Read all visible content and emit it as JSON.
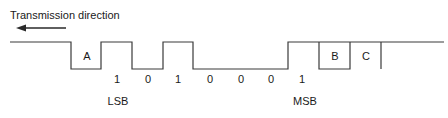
{
  "title": "Transmission direction",
  "colors": {
    "stroke": "#3a3a3a",
    "text": "#1a1a1a",
    "background": "#ffffff"
  },
  "arrow": {
    "direction": "left",
    "x1": 66,
    "x2": 18,
    "y": 28
  },
  "waveform": {
    "high_y": 42,
    "low_y": 69,
    "segments_labels": [
      "A",
      "B",
      "C"
    ],
    "bits": [
      "1",
      "0",
      "1",
      "0",
      "0",
      "0",
      "1"
    ],
    "lsb_label": "LSB",
    "msb_label": "MSB"
  },
  "labels": {
    "A": "A",
    "B": "B",
    "C": "C",
    "bit0": "1",
    "bit1": "0",
    "bit2": "1",
    "bit3": "0",
    "bit4": "0",
    "bit5": "0",
    "bit6": "1",
    "lsb": "LSB",
    "msb": "MSB"
  }
}
